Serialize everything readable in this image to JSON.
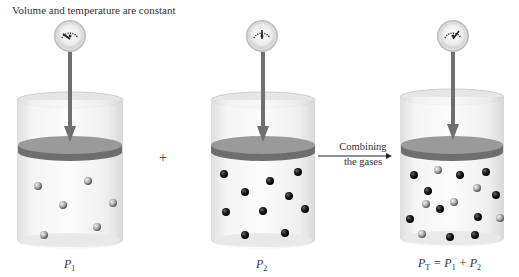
{
  "caption": "Volume and temperature are constant",
  "operator_plus": "+",
  "arrow_label": {
    "line1": "Combining",
    "line2": "the gases"
  },
  "colors": {
    "piston_top": "#9a9a9a",
    "piston_side": "#6e6e6e",
    "piston_arrow": "#6f6f6f",
    "gas1_particle": "#b8b8b8",
    "gas2_particle": "#1a1a1a",
    "beaker_glass": "#eeeeee"
  },
  "beakers": [
    {
      "id": "gas-1",
      "label_main": "P",
      "label_sub": "1",
      "label_full": "P1",
      "gauge_reading": "low",
      "particles": {
        "light": 6,
        "dark": 0
      }
    },
    {
      "id": "gas-2",
      "label_main": "P",
      "label_sub": "2",
      "label_full": "P2",
      "gauge_reading": "medium",
      "particles": {
        "light": 0,
        "dark": 10
      }
    },
    {
      "id": "mixture",
      "label_main": "P",
      "label_sub": "T",
      "label_full": "PT = P1 + P2",
      "equation_rest": " = P",
      "equation_sub1": "1",
      "equation_plus": " + P",
      "equation_sub2": "2",
      "gauge_reading": "high",
      "particles": {
        "light": 6,
        "dark": 10
      }
    }
  ]
}
